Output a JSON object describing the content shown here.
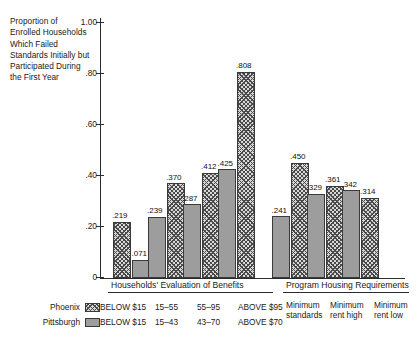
{
  "chart_data": {
    "type": "bar",
    "title": "",
    "ylabel": "Proportion of Enrolled Households Which Failed Standards Initially but Participated During the First Year",
    "xlabel": "",
    "ylim": [
      0,
      1.0
    ],
    "yticks": [
      "0",
      ".20",
      ".40",
      ".60",
      ".80",
      "1.00"
    ],
    "ytick_values": [
      0,
      0.2,
      0.4,
      0.6,
      0.8,
      1.0
    ],
    "grid": false,
    "legend_position": "below-left",
    "series": [
      {
        "name": "Phoenix",
        "pattern": "crosshatch",
        "values": [
          0.219,
          0.37,
          0.412,
          0.808,
          0.45,
          0.361,
          0.314
        ],
        "labels": [
          ".219",
          ".370",
          ".412",
          ".808",
          ".450",
          ".361",
          ".314"
        ]
      },
      {
        "name": "Pittsburgh",
        "pattern": "solid-gray",
        "values": [
          0.071,
          0.239,
          0.287,
          0.425,
          0.241,
          0.329,
          0.342
        ],
        "labels": [
          ".071",
          ".239",
          ".287",
          ".425",
          ".241",
          ".329",
          ".342"
        ]
      }
    ],
    "bars": [
      {
        "label": ".219",
        "value": 0.219,
        "series": "Phoenix",
        "group": 0
      },
      {
        "label": ".071",
        "value": 0.071,
        "series": "Pittsburgh",
        "group": 0
      },
      {
        "label": ".239",
        "value": 0.239,
        "series": "Pittsburgh",
        "group": 1
      },
      {
        "label": ".370",
        "value": 0.37,
        "series": "Phoenix",
        "group": 1
      },
      {
        "label": ".287",
        "value": 0.287,
        "series": "Pittsburgh",
        "group": 2
      },
      {
        "label": ".412",
        "value": 0.412,
        "series": "Phoenix",
        "group": 2
      },
      {
        "label": ".425",
        "value": 0.425,
        "series": "Pittsburgh",
        "group": 3
      },
      {
        "label": ".808",
        "value": 0.808,
        "series": "Phoenix",
        "group": 3
      },
      {
        "label": ".241",
        "value": 0.241,
        "series": "Pittsburgh",
        "group": 4
      },
      {
        "label": ".450",
        "value": 0.45,
        "series": "Phoenix",
        "group": 4
      },
      {
        "label": ".329",
        "value": 0.329,
        "series": "Pittsburgh",
        "group": 5
      },
      {
        "label": ".361",
        "value": 0.361,
        "series": "Phoenix",
        "group": 5
      },
      {
        "label": ".342",
        "value": 0.342,
        "series": "Pittsburgh",
        "group": 6
      },
      {
        "label": ".314",
        "value": 0.314,
        "series": "Phoenix",
        "group": 6
      }
    ],
    "section_captions": [
      "Households' Evaluation of Benefits",
      "Program Housing Requirements"
    ],
    "categories_phoenix": [
      "BELOW  $15",
      "15–55",
      "55–95",
      "ABOVE  $95"
    ],
    "categories_pittsburgh": [
      "BELOW  $15",
      "15–43",
      "43–70",
      "ABOVE  $70"
    ],
    "requirement_categories": [
      {
        "line1": "Minimum",
        "line2": "standards"
      },
      {
        "line1": "Minimum",
        "line2": "rent high"
      },
      {
        "line1": "Minimum",
        "line2": "rent low"
      }
    ]
  },
  "colors": {
    "axis": "#2b2b2b",
    "text": "#1a1a1a",
    "phoenix_fill": "#d8d8d8",
    "phoenix_hatch": "#4a4a4a",
    "pittsburgh_fill": "#9d9d9d",
    "bar_border": "#3a3a3a",
    "background": "#ffffff"
  }
}
